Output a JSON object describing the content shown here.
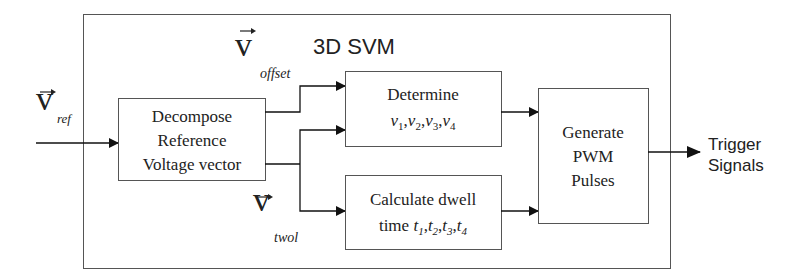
{
  "diagram": {
    "title": "3D SVM",
    "colors": {
      "line": "#222222",
      "box_border": "#555555",
      "text": "#222222",
      "background": "#ffffff"
    },
    "inputs": {
      "ref": {
        "symbol": "v",
        "subscript": "ref"
      }
    },
    "signals": {
      "offset": {
        "symbol": "v",
        "subscript": "offset"
      },
      "twol": {
        "symbol": "v",
        "subscript": "twol"
      }
    },
    "blocks": {
      "decompose": {
        "line1": "Decompose",
        "line2": "Reference",
        "line3": "Voltage vector"
      },
      "determine": {
        "line1": "Determine",
        "vars": [
          "v",
          "v",
          "v",
          "v"
        ],
        "subs": [
          "1",
          "2",
          "3",
          "4"
        ]
      },
      "calculate": {
        "line1": "Calculate dwell",
        "prefix": "time",
        "vars": [
          "t",
          "t",
          "t",
          "t"
        ],
        "subs": [
          "1",
          "2",
          "3",
          "4"
        ]
      },
      "generate": {
        "line1": "Generate",
        "line2": "PWM",
        "line3": "Pulses"
      }
    },
    "output": {
      "line1": "Trigger",
      "line2": "Signals"
    }
  }
}
